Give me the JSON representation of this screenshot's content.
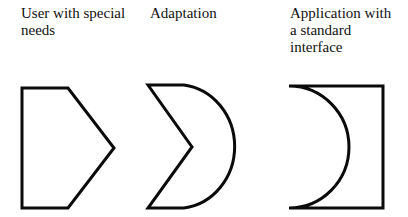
{
  "diagram": {
    "labels": {
      "user": "User with special\nneeds",
      "adaptation": "Adaptation",
      "application": "Application with\na standard\ninterface"
    },
    "shapes": [
      {
        "name": "user-shape",
        "kind": "pentagon-arrow"
      },
      {
        "name": "adaptation-shape",
        "kind": "crescent-chevron"
      },
      {
        "name": "application-shape",
        "kind": "rectangle-with-concave-left"
      }
    ],
    "stroke_color": "#0a0a0a",
    "background_color": "#ffffff"
  }
}
